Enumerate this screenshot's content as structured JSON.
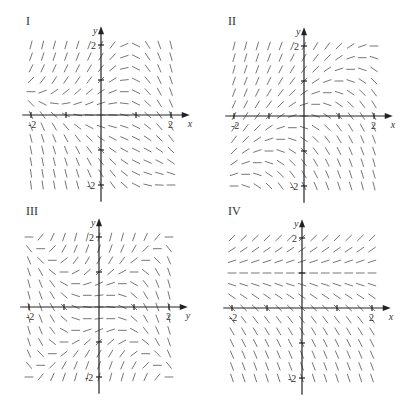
{
  "figure": {
    "colors": {
      "axis": "#222222",
      "segment": "#666666",
      "text": "#333333",
      "background": "#ffffff"
    },
    "panels": [
      {
        "id": "I",
        "label": "I",
        "origin": [
          101,
          115
        ],
        "unit_px": 35,
        "label_pos": [
          26,
          25
        ],
        "x_axis_label": "x",
        "y_axis_label": "y",
        "x_tick_labels": [
          "-2",
          "2"
        ],
        "y_tick_labels": [
          "2",
          "-2"
        ],
        "slope_field_desc": "horizontal near x-axis for small x; steep positive upper-left, steep negative upper-right and lower regions",
        "slope_formula": "y - x*x*0.5 - x*y"
      },
      {
        "id": "II",
        "label": "II",
        "origin": [
          304,
          116
        ],
        "unit_px": 35,
        "label_pos": [
          228,
          25
        ],
        "x_axis_label": "x",
        "y_axis_label": "y",
        "x_tick_labels": [
          "-2",
          "2"
        ],
        "y_tick_labels": [
          "2",
          "-2"
        ],
        "slope_field_desc": "horizontal along diagonal y=x; steep positive upper-left, steep negative lower-right",
        "slope_formula": "y - x"
      },
      {
        "id": "III",
        "label": "III",
        "origin": [
          99,
          307
        ],
        "unit_px": 35,
        "label_pos": [
          26,
          215
        ],
        "x_axis_label": "y",
        "y_axis_label": "y",
        "x_tick_labels": [
          "-2",
          "2"
        ],
        "y_tick_labels": [
          "2",
          "-2"
        ],
        "slope_field_desc": "horizontal near center; negative steep on left/right sides near x-axis; positive steep near y-axis top/bottom",
        "slope_formula": "y*y - x*x"
      },
      {
        "id": "IV",
        "label": "IV",
        "origin": [
          302,
          308
        ],
        "unit_px": 35,
        "label_pos": [
          228,
          215
        ],
        "x_axis_label": "x",
        "y_axis_label": "y",
        "x_tick_labels": [
          "-2",
          "2"
        ],
        "y_tick_labels": [
          "2",
          "-2"
        ],
        "slope_field_desc": "slopes depend only on y; horizontal at y=1, positive above, negative steep below",
        "slope_formula": "y - 1"
      }
    ],
    "grid": {
      "min": -2,
      "max": 2,
      "count": 13,
      "segment_half_len_px": 4
    }
  }
}
